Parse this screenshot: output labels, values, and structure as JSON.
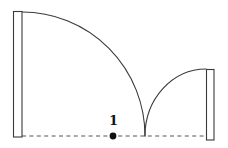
{
  "figure": {
    "background_color": "#ffffff",
    "stroke_color": "#3a3a3a",
    "dash_color": "#555555",
    "dot_color": "#111111",
    "canvas": {
      "width": 228,
      "height": 148
    }
  },
  "labels": {
    "point_value": "1"
  },
  "geometry": {
    "baseline": {
      "y": 136,
      "x_start": 22,
      "x_end": 214,
      "style": "dashed"
    },
    "left_bar": {
      "x": 13,
      "y": 11,
      "width": 9,
      "height": 126
    },
    "right_bar": {
      "x": 206,
      "y": 69,
      "width": 8,
      "height": 71
    },
    "large_arc": {
      "start_x": 22,
      "start_y": 12,
      "end_x": 145,
      "end_y": 136,
      "radius_x": 123,
      "radius_y": 124
    },
    "small_arc": {
      "start_x": 145,
      "start_y": 136,
      "end_x": 206,
      "end_y": 69,
      "radius_x": 61,
      "radius_y": 67
    },
    "marked_point": {
      "x": 113,
      "y": 136
    },
    "label_position": {
      "x": 109,
      "y": 114
    }
  }
}
